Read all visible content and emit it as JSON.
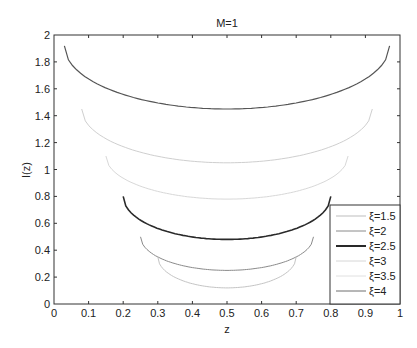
{
  "chart_data": {
    "type": "line",
    "title": "M=1",
    "xlabel": "z",
    "ylabel": "I(z)",
    "xlim": [
      0,
      1
    ],
    "ylim": [
      0,
      2
    ],
    "xticks": [
      "0",
      "0.1",
      "0.2",
      "0.3",
      "0.4",
      "0.5",
      "0.6",
      "0.7",
      "0.8",
      "0.9",
      "1"
    ],
    "yticks": [
      "0",
      "0.2",
      "0.4",
      "0.6",
      "0.8",
      "1",
      "1.2",
      "1.4",
      "1.6",
      "1.8",
      "2"
    ],
    "grid": false,
    "legend_position": "lower right (inside)",
    "series": [
      {
        "name": "ξ=1.5",
        "color": "#bdbdbd",
        "legend_width": 1,
        "z_range": [
          0.03,
          0.97
        ],
        "endpoint_value": 1.92,
        "min_value": 1.45,
        "curve_color": "#555555",
        "curve_width": 1.2
      },
      {
        "name": "ξ=2",
        "color": "#8a8a8a",
        "legend_width": 1,
        "z_range": [
          0.08,
          0.92
        ],
        "endpoint_value": 1.45,
        "min_value": 1.05,
        "curve_color": "#cfcfcf",
        "curve_width": 1
      },
      {
        "name": "ξ=2.5",
        "color": "#111111",
        "legend_width": 1.8,
        "z_range": [
          0.15,
          0.85
        ],
        "endpoint_value": 1.1,
        "min_value": 0.78,
        "curve_color": "#d8d8d8",
        "curve_width": 1
      },
      {
        "name": "ξ=3",
        "color": "#d6d6d6",
        "legend_width": 1,
        "z_range": [
          0.2,
          0.8
        ],
        "endpoint_value": 0.8,
        "min_value": 0.48,
        "curve_color": "#2a2a2a",
        "curve_width": 1.6
      },
      {
        "name": "ξ=3.5",
        "color": "#e0e0e0",
        "legend_width": 1,
        "z_range": [
          0.25,
          0.75
        ],
        "endpoint_value": 0.5,
        "min_value": 0.25,
        "curve_color": "#8a8a8a",
        "curve_width": 1
      },
      {
        "name": "ξ=4",
        "color": "#6e6e6e",
        "legend_width": 1,
        "z_range": [
          0.3,
          0.7
        ],
        "endpoint_value": 0.35,
        "min_value": 0.12,
        "curve_color": "#c4c4c4",
        "curve_width": 1
      }
    ]
  }
}
